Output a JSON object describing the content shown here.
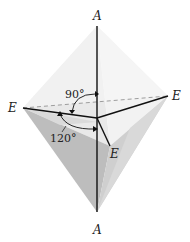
{
  "diagram": {
    "type": "trigonal bipyramidal geometry",
    "labels": {
      "axial_top": "A",
      "axial_bottom": "A",
      "equatorial_left": "E",
      "equatorial_right": "E",
      "equatorial_front": "E"
    },
    "angles": {
      "axial_equatorial": "90°",
      "equatorial_equatorial": "120°"
    },
    "colors": {
      "face_light": "#ececec",
      "face_mid": "#d4d4d4",
      "face_dark": "#b8b8b8",
      "bond": "#111111"
    }
  }
}
